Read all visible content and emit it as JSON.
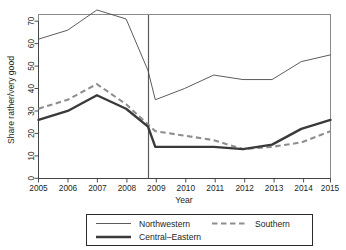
{
  "chart_data": {
    "type": "line",
    "title": "",
    "xlabel": "Year",
    "ylabel": "Share rather/very good",
    "x": [
      2005,
      2006,
      2007,
      2008,
      2009,
      2010,
      2011,
      2012,
      2013,
      2014,
      2015
    ],
    "xtick_labels": [
      "2005",
      "2006",
      "2007",
      "2008",
      "2009",
      "2010",
      "2011",
      "2012",
      "2013",
      "2014",
      "2015"
    ],
    "ytick_labels": [
      "0",
      "10",
      "20",
      "30",
      "40",
      "50",
      "60",
      "70"
    ],
    "ytick_values": [
      0,
      10,
      20,
      30,
      40,
      50,
      60,
      70
    ],
    "xlim": [
      2005,
      2015
    ],
    "ylim": [
      0,
      70
    ],
    "grid": false,
    "legend_position": "bottom-outside",
    "annotations": [
      {
        "type": "vertical-line",
        "x": 2008.75,
        "label": "break-in-series"
      }
    ],
    "series": [
      {
        "name": "Northwestern",
        "style": "thin-solid",
        "color": "#4a4a4a",
        "values": [
          62,
          66,
          75,
          71,
          35,
          40,
          46,
          44,
          44,
          52,
          55
        ],
        "pre_break_value": 48,
        "break_x": 2008.75
      },
      {
        "name": "Southern",
        "style": "dashed",
        "color": "#8e8e8e",
        "values": [
          31,
          35,
          42,
          33,
          21,
          19,
          17,
          13,
          14,
          16,
          21
        ],
        "pre_break_value": 24,
        "break_x": 2008.75
      },
      {
        "name": "Central–Eastern",
        "style": "thick-solid",
        "color": "#3a3a3a",
        "values": [
          26,
          30,
          37,
          31,
          14,
          14,
          14,
          13,
          15,
          22,
          26
        ],
        "pre_break_value": 23,
        "break_x": 2008.75
      }
    ]
  },
  "axes": {
    "y_title": "Share rather/very good",
    "x_title": "Year",
    "ytick_labels": [
      "70",
      "60",
      "50",
      "40",
      "30",
      "20",
      "10",
      "0"
    ],
    "xtick_labels": [
      "2005",
      "2006",
      "2007",
      "2008",
      "2009",
      "2010",
      "2011",
      "2012",
      "2013",
      "2014",
      "2015"
    ]
  },
  "legend": {
    "entries": [
      {
        "label": "Northwestern",
        "style": "thin-solid"
      },
      {
        "label": "Southern",
        "style": "dashed"
      },
      {
        "label": "Central–Eastern",
        "style": "thick-solid"
      }
    ]
  }
}
